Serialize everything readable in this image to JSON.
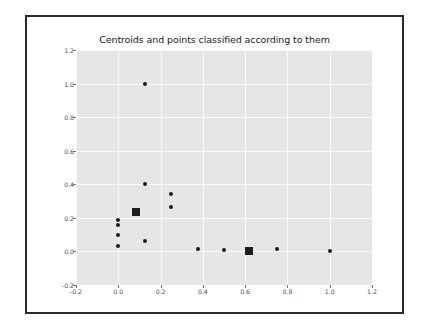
{
  "chart_data": {
    "type": "scatter",
    "title": "Centroids and points classified according to them",
    "xlabel": "",
    "ylabel": "",
    "xlim": [
      -0.2,
      1.2
    ],
    "ylim": [
      -0.2,
      1.2
    ],
    "grid": true,
    "legend": "none",
    "background": "#e6e6e6",
    "gridline_color": "#fbfbfb",
    "marker_color": "#1c1c1c",
    "xticks": [
      "-0.2",
      "0.0",
      "0.2",
      "0.4",
      "0.6",
      "0.8",
      "1.0",
      "1.2"
    ],
    "xtick_values": [
      -0.2,
      0.0,
      0.2,
      0.4,
      0.6,
      0.8,
      1.0,
      1.2
    ],
    "yticks": [
      "-0.2",
      "0.0",
      "0.2",
      "0.4",
      "0.6",
      "0.8",
      "1.0",
      "1.2"
    ],
    "ytick_values": [
      -0.2,
      0.0,
      0.2,
      0.4,
      0.6,
      0.8,
      1.0,
      1.2
    ],
    "series": [
      {
        "name": "points",
        "marker": "circle",
        "size": 4,
        "x": [
          0.125,
          0.125,
          0.25,
          0.25,
          0.0,
          0.0,
          0.0,
          0.0,
          0.125,
          0.375,
          0.5,
          0.75,
          1.0
        ],
        "y": [
          1.0,
          0.4,
          0.345,
          0.265,
          0.185,
          0.155,
          0.1,
          0.035,
          0.06,
          0.015,
          0.01,
          0.015,
          0.0
        ]
      },
      {
        "name": "centroids",
        "marker": "square",
        "size": 8,
        "x": [
          0.085,
          0.62
        ],
        "y": [
          0.235,
          0.005
        ]
      }
    ]
  }
}
